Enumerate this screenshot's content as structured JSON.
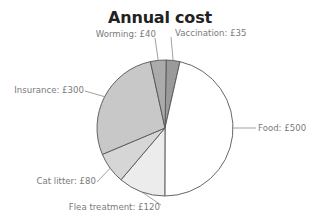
{
  "chart_data": {
    "type": "pie",
    "title": "Annual cost",
    "categories": [
      "Vaccination",
      "Food",
      "Flea treatment",
      "Cat litter",
      "Insurance",
      "Worming"
    ],
    "values": [
      35,
      500,
      120,
      80,
      300,
      40
    ],
    "unit": "£",
    "labels": [
      "Vaccination: £35",
      "Food: £500",
      "Flea treatment: £120",
      "Cat litter: £80",
      "Insurance: £300",
      "Worming: £40"
    ],
    "colors": [
      "#9a9a9a",
      "#ffffff",
      "#ececec",
      "#d6d6d6",
      "#c8c8c8",
      "#ababab"
    ],
    "start_angle_deg": 1,
    "direction": "clockwise",
    "legend": "none (leader-line labels)"
  },
  "title": "Annual cost",
  "pie": {
    "cx": 165,
    "cy": 128,
    "r": 68,
    "stroke": "#555555"
  }
}
